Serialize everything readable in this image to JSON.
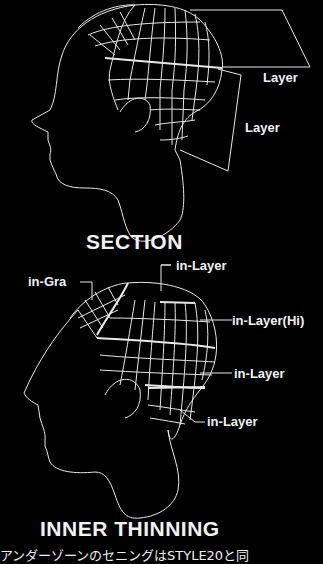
{
  "diagram1": {
    "labels": [
      "Layer",
      "Layer"
    ],
    "title": "SECTION"
  },
  "diagram2": {
    "labels": {
      "top": "in-Layer",
      "left": "in-Gra",
      "hi": "in-Layer(Hi)",
      "mid": "in-Layer",
      "low": "in-Layer"
    },
    "title": "INNER THINNING"
  },
  "caption": "アンダーゾーンのセニングはSTYLE20と同",
  "colors": {
    "background": "#000000",
    "line": "#ffffff"
  }
}
